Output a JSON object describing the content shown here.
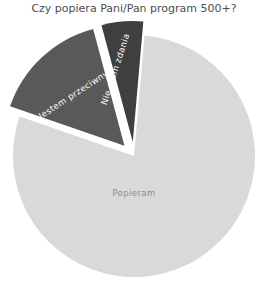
{
  "chart_data": {
    "type": "pie",
    "title": "Czy popiera Pani/Pan program 500+?",
    "xlabel": "",
    "ylabel": "",
    "legend": "none",
    "grid": false,
    "categories": [
      "Popieram",
      "Jestem przeciwny",
      "Nie mam zdania"
    ],
    "values": [
      79,
      15.5,
      5.5
    ],
    "colors": [
      "#d9d9d9",
      "#595959",
      "#3f3f3f"
    ],
    "label_colors": [
      "#8c8c8c",
      "#ffffff",
      "#ffffff"
    ],
    "exploded": [
      false,
      true,
      true
    ],
    "slices": [
      {
        "label": "Popieram",
        "value": 79,
        "color": "#d9d9d9",
        "label_color": "#8c8c8c",
        "exploded": false,
        "start_angle_deg": 5,
        "end_angle_deg": 289
      },
      {
        "label": "Jestem przeciwny",
        "value": 15.5,
        "color": "#595959",
        "label_color": "#ffffff",
        "exploded": true,
        "start_angle_deg": 289,
        "end_angle_deg": 345
      },
      {
        "label": "Nie mam zdania",
        "value": 5.5,
        "color": "#3f3f3f",
        "label_color": "#ffffff",
        "exploded": true,
        "start_angle_deg": 345,
        "end_angle_deg": 365
      }
    ],
    "geometry": {
      "center_x": 134,
      "center_y": 156,
      "radius": 121
    },
    "background_color": "#ffffff",
    "title_color": "#4d4d4d"
  },
  "labels": {
    "popieram": "Popieram",
    "jestem_przeciwny": "Jestem przeciwny",
    "nie_mam_zdania": "Nie mam zdania"
  }
}
